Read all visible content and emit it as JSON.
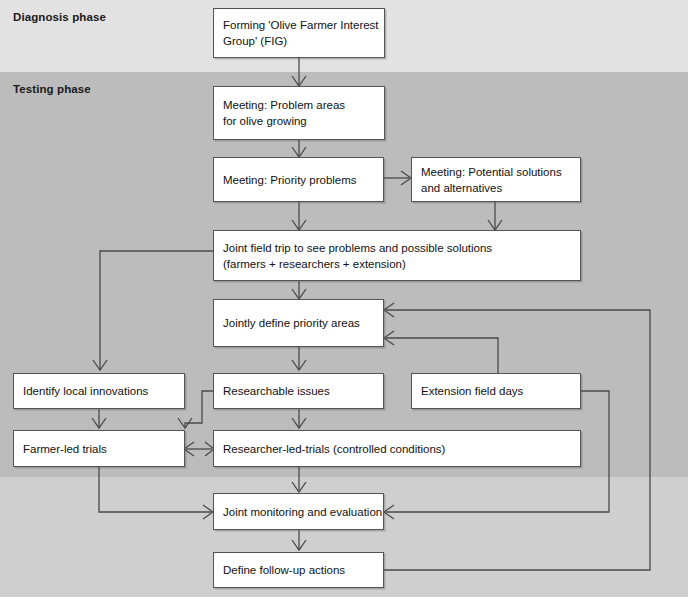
{
  "diagram": {
    "phases": [
      {
        "id": "diagnosis",
        "label": "Diagnosis phase",
        "band_color": "#e2e2e2"
      },
      {
        "id": "testing",
        "label": "Testing phase",
        "band_color": "#bcbcbc"
      }
    ],
    "nodes": [
      {
        "id": "fig",
        "lines": [
          "Forming 'Olive Farmer Interest",
          "Group' (FIG)"
        ]
      },
      {
        "id": "problem",
        "lines": [
          "Meeting: Problem areas",
          "for olive growing"
        ]
      },
      {
        "id": "priority",
        "lines": [
          "Meeting: Priority problems"
        ]
      },
      {
        "id": "potential",
        "lines": [
          "Meeting: Potential solutions",
          "and alternatives"
        ]
      },
      {
        "id": "fieldtrip",
        "lines": [
          "Joint field trip to see problems and possible solutions",
          "(farmers + researchers + extension)"
        ]
      },
      {
        "id": "definearea",
        "lines": [
          "Jointly define priority areas"
        ]
      },
      {
        "id": "localinnov",
        "lines": [
          "Identify local innovations"
        ]
      },
      {
        "id": "research",
        "lines": [
          "Researchable issues"
        ]
      },
      {
        "id": "extension",
        "lines": [
          "Extension field days"
        ]
      },
      {
        "id": "farmertr",
        "lines": [
          "Farmer-led trials"
        ]
      },
      {
        "id": "researchtr",
        "lines": [
          "Researcher-led-trials (controlled conditions)"
        ]
      },
      {
        "id": "monitor",
        "lines": [
          "Joint monitoring and evaluation"
        ]
      },
      {
        "id": "followup",
        "lines": [
          "Define follow-up actions"
        ]
      }
    ],
    "colors": {
      "node_fill": "#ffffff",
      "node_border": "#555555",
      "connector": "#4a4a4a",
      "text": "#111111"
    }
  }
}
